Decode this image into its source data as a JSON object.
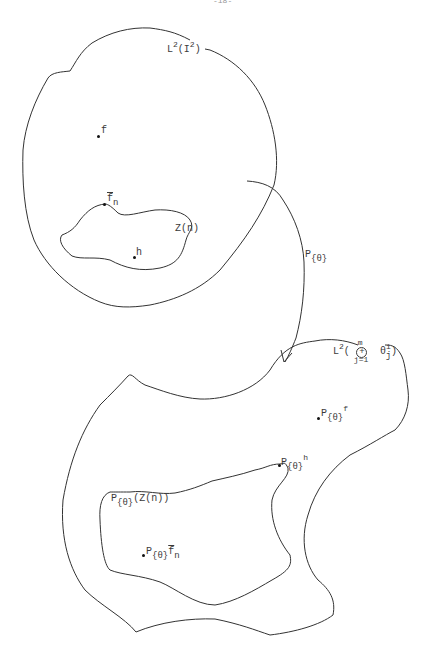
{
  "diagram": {
    "page_marker": "-18-",
    "top_space": {
      "label_base": "L",
      "label_sup": "2",
      "label_arg": "(I",
      "label_arg_sup": "2",
      "label_close": ")",
      "points": {
        "f": "f",
        "fn_base": "f",
        "fn_sub": "n",
        "h": "h"
      },
      "subset": {
        "label": "Z(n)"
      }
    },
    "mapping": {
      "label_base": "P",
      "label_sub": "{θ}"
    },
    "bottom_space": {
      "label_base": "L",
      "label_sup": "2",
      "label_open": "(",
      "oplus_top": "m",
      "oplus_symbol": "+",
      "oplus_bottom": "j=1",
      "theta": "θ",
      "theta_sup": "i",
      "theta_sub": "j",
      "label_close": ")",
      "points": {
        "pf_base": "P",
        "pf_sub": "{θ}",
        "pf_sup": "f",
        "ph_base": "P",
        "ph_sub": "{θ}",
        "ph_sup": "h",
        "pfn_base": "P",
        "pfn_sub": "{θ}",
        "pfn_f": "f",
        "pfn_n": "n"
      },
      "subset": {
        "label_base": "P",
        "label_sub": "{θ}",
        "label_arg": "(Z(n))"
      }
    }
  }
}
